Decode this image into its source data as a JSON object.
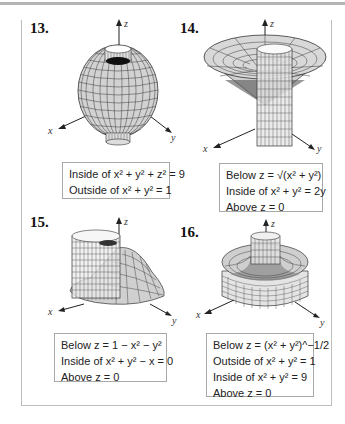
{
  "problems": [
    {
      "number": "13.",
      "caption": [
        "Inside of x² + y² + z² = 9",
        "Outside of x² + y² = 1"
      ]
    },
    {
      "number": "14.",
      "caption": [
        "Below z = √(x² + y²)",
        "Inside of x² + y² = 2y",
        "Above z = 0"
      ]
    },
    {
      "number": "15.",
      "caption": [
        "Below z = 1 − x² − y²",
        "Inside of x² + y² − x = 0",
        "Above z = 0"
      ]
    },
    {
      "number": "16.",
      "caption": [
        "Below z = (x² + y²)^−1/2",
        "Outside of x² + y² = 1",
        "Inside of x² + y² = 9",
        "Above z = 0"
      ]
    }
  ],
  "axes": {
    "x": "x",
    "y": "y",
    "z": "z"
  },
  "colors": {
    "surface_fill": "#d4d4d4",
    "grid_line": "#3a3a3a",
    "frame": "#bdbdbd",
    "top_rule": "#b5b5b5"
  }
}
